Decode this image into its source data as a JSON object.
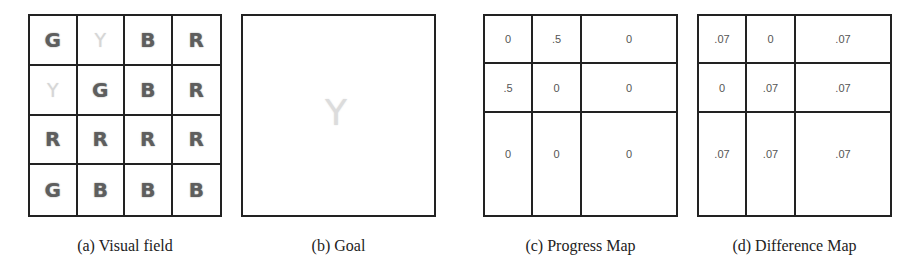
{
  "panels": {
    "visual_field": {
      "caption": "(a) Visual field",
      "grid": [
        [
          "G",
          "Y",
          "B",
          "R"
        ],
        [
          "Y",
          "G",
          "B",
          "R"
        ],
        [
          "R",
          "R",
          "R",
          "R"
        ],
        [
          "G",
          "B",
          "B",
          "B"
        ]
      ]
    },
    "goal": {
      "caption": "(b) Goal",
      "glyph": "Y"
    },
    "progress_map": {
      "caption": "(c) Progress Map",
      "grid": [
        [
          "0",
          ".5",
          "0"
        ],
        [
          ".5",
          "0",
          "0"
        ],
        [
          "0",
          "0",
          "0"
        ]
      ]
    },
    "difference_map": {
      "caption": "(d) Difference Map",
      "grid": [
        [
          ".07",
          "0",
          ".07"
        ],
        [
          "0",
          ".07",
          ".07"
        ],
        [
          ".07",
          ".07",
          ".07"
        ]
      ]
    }
  },
  "colors": {
    "letter": "#5e5e5e",
    "faded_letter": "#d6d6d6",
    "grid_line": "#222222"
  }
}
